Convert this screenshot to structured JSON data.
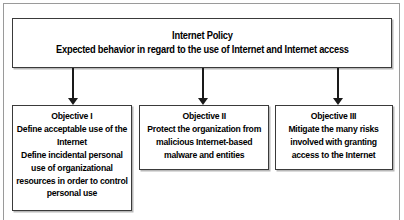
{
  "diagram": {
    "type": "hierarchy-flowchart",
    "frame": {
      "present": true,
      "border_color": "#9a9a9a"
    },
    "colors": {
      "box_border": "#3a3a3a",
      "box_fill": "#ffffff",
      "box_shadow": "#b8b8b8",
      "arrow": "#1a1a1a",
      "text": "#000000"
    },
    "root": {
      "name": "internet-policy",
      "lines": [
        "Internet Policy",
        "Expected behavior in regard to the use of Internet and Internet access"
      ]
    },
    "children": [
      {
        "name": "objective-1",
        "title": "Objective I",
        "lines": [
          "Objective I",
          "Define acceptable use of the",
          "Internet",
          "Define incidental personal",
          "use of organizational",
          "resources in order to control",
          "personal use"
        ]
      },
      {
        "name": "objective-2",
        "title": "Objective II",
        "lines": [
          "Objective II",
          "Protect the organization from",
          "malicious Internet-based",
          "malware and entities"
        ]
      },
      {
        "name": "objective-3",
        "title": "Objective III",
        "lines": [
          "Objective III",
          "Mitigate the many risks",
          "involved with granting",
          "access to the Internet"
        ]
      }
    ],
    "connectors": [
      {
        "name": "arrow-to-objective-1",
        "icon": "down-arrow-icon",
        "from": "internet-policy",
        "to": "objective-1"
      },
      {
        "name": "arrow-to-objective-2",
        "icon": "down-arrow-icon",
        "from": "internet-policy",
        "to": "objective-2"
      },
      {
        "name": "arrow-to-objective-3",
        "icon": "down-arrow-icon",
        "from": "internet-policy",
        "to": "objective-3"
      }
    ]
  }
}
